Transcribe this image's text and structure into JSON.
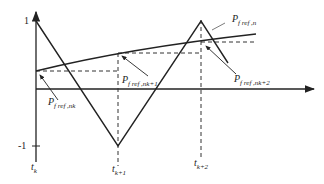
{
  "diagram": {
    "type": "waveform-diagram",
    "y_ticks": {
      "top": "1",
      "bottom": "-1"
    },
    "x_ticks": [
      {
        "main": "t",
        "sub": "k"
      },
      {
        "main": "t",
        "sub": "k+1"
      },
      {
        "main": "t",
        "sub": "k+2"
      }
    ],
    "labels": {
      "p_ref_n": {
        "main": "P",
        "sub": "f ref ,n"
      },
      "p_ref_nk": {
        "main": "P",
        "sub": "f ref ,nk"
      },
      "p_ref_nk1": {
        "main": "P",
        "sub": "f ref ,nk+1"
      },
      "p_ref_nk2": {
        "main": "P",
        "sub": "f ref ,nk+2"
      }
    },
    "colors": {
      "line": "#222222",
      "dash": "#333333"
    }
  }
}
